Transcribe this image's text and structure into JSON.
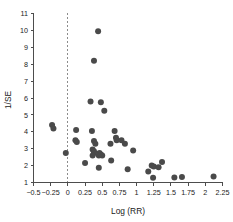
{
  "chart_data": {
    "type": "scatter",
    "title": "",
    "xlabel": "Log (RR)",
    "ylabel": "1/SE",
    "xlim": [
      -0.5,
      2.25
    ],
    "ylim": [
      1,
      11
    ],
    "grid": false,
    "legend": null,
    "xticks": [
      -0.5,
      -0.25,
      0,
      0.25,
      0.5,
      0.75,
      1,
      1.25,
      1.5,
      1.75,
      2,
      2.25
    ],
    "xticklabels": [
      "−0.5",
      "−0.25",
      "0",
      "0.25",
      "0.5",
      "0.75",
      "1",
      "1.25",
      "1.5",
      "1.75",
      "2",
      "2.25"
    ],
    "yticks": [
      1,
      2,
      3,
      4,
      5,
      6,
      7,
      8,
      9,
      10,
      11
    ],
    "yticklabels": [
      "1",
      "2",
      "3",
      "4",
      "5",
      "6",
      "7",
      "8",
      "9",
      "10",
      "11"
    ],
    "annotations": [
      {
        "type": "vline",
        "x": 0,
        "style": "dashed",
        "label": "null-effect-reference-line"
      }
    ],
    "marker": {
      "shape": "circle",
      "size": 3.0,
      "color": "#4a4a4a"
    },
    "points": [
      {
        "x": -0.23,
        "y": 4.4
      },
      {
        "x": -0.21,
        "y": 4.2
      },
      {
        "x": -0.03,
        "y": 2.75
      },
      {
        "x": 0.12,
        "y": 4.1
      },
      {
        "x": 0.11,
        "y": 3.5
      },
      {
        "x": 0.13,
        "y": 3.4
      },
      {
        "x": 0.25,
        "y": 2.15
      },
      {
        "x": 0.33,
        "y": 5.8
      },
      {
        "x": 0.35,
        "y": 4.05
      },
      {
        "x": 0.38,
        "y": 3.45
      },
      {
        "x": 0.4,
        "y": 3.3
      },
      {
        "x": 0.36,
        "y": 2.95
      },
      {
        "x": 0.38,
        "y": 2.85
      },
      {
        "x": 0.38,
        "y": 2.75
      },
      {
        "x": 0.36,
        "y": 2.6
      },
      {
        "x": 0.38,
        "y": 8.2
      },
      {
        "x": 0.44,
        "y": 9.95
      },
      {
        "x": 0.46,
        "y": 2.75
      },
      {
        "x": 0.45,
        "y": 2.6
      },
      {
        "x": 0.48,
        "y": 2.65
      },
      {
        "x": 0.5,
        "y": 2.6
      },
      {
        "x": 0.48,
        "y": 5.75
      },
      {
        "x": 0.53,
        "y": 5.25
      },
      {
        "x": 0.45,
        "y": 1.88
      },
      {
        "x": 0.62,
        "y": 3.3
      },
      {
        "x": 0.63,
        "y": 2.3
      },
      {
        "x": 0.68,
        "y": 4.05
      },
      {
        "x": 0.7,
        "y": 3.65
      },
      {
        "x": 0.71,
        "y": 3.5
      },
      {
        "x": 0.78,
        "y": 3.5
      },
      {
        "x": 0.83,
        "y": 3.3
      },
      {
        "x": 0.87,
        "y": 1.78
      },
      {
        "x": 0.95,
        "y": 2.9
      },
      {
        "x": 1.17,
        "y": 1.65
      },
      {
        "x": 1.22,
        "y": 2.0
      },
      {
        "x": 1.25,
        "y": 1.95
      },
      {
        "x": 1.24,
        "y": 1.28
      },
      {
        "x": 1.32,
        "y": 1.9
      },
      {
        "x": 1.37,
        "y": 2.22
      },
      {
        "x": 1.55,
        "y": 1.3
      },
      {
        "x": 1.66,
        "y": 1.32
      },
      {
        "x": 2.12,
        "y": 1.35
      }
    ]
  }
}
